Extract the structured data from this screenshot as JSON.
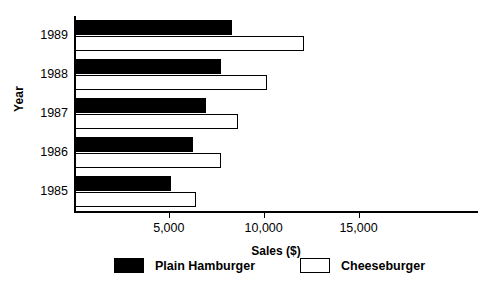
{
  "chart_data": {
    "type": "bar",
    "orientation": "horizontal",
    "title": "",
    "xlabel": "Sales ($)",
    "ylabel": "Year",
    "categories": [
      "1985",
      "1986",
      "1987",
      "1988",
      "1989"
    ],
    "series": [
      {
        "name": "Plain Hamburger",
        "color": "#000000",
        "style": "filled",
        "values": [
          5050,
          6200,
          6900,
          7700,
          8300
        ]
      },
      {
        "name": "Cheeseburger",
        "color": "#ffffff",
        "style": "outlined",
        "values": [
          6400,
          7700,
          8600,
          10100,
          12050
        ]
      }
    ],
    "xlim": [
      0,
      21300
    ],
    "xticks": [
      5000,
      10000,
      15000
    ],
    "xtick_labels": [
      "5,000",
      "10,000",
      "15,000"
    ],
    "grid": false,
    "legend_position": "bottom"
  },
  "legend": {
    "entries": [
      {
        "label": "Plain Hamburger",
        "style": "plain"
      },
      {
        "label": "Cheeseburger",
        "style": "cheese"
      }
    ]
  }
}
